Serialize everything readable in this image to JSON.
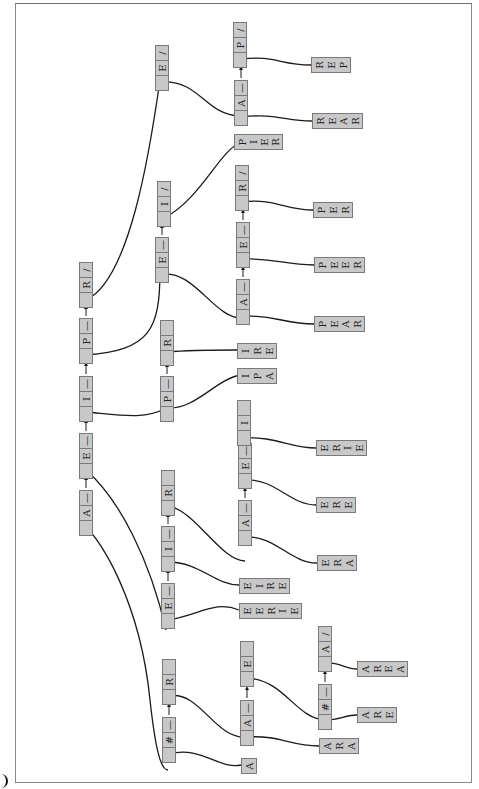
{
  "diagram": {
    "title": "",
    "type": "trie-linked-list",
    "orientation": "rotated-90-ccw",
    "colors": {
      "node_fill": "#c8c8c8",
      "node_border": "#7a7a7a",
      "edge": "#1a1a1a",
      "frame": "#8a8a8a"
    },
    "nodes": [
      {
        "id": "L1-A",
        "x": 79,
        "y": 490,
        "cells": [
          "",
          "A",
          "—"
        ]
      },
      {
        "id": "L1-E",
        "x": 79,
        "y": 433,
        "cells": [
          "",
          "E",
          "—"
        ]
      },
      {
        "id": "L1-I",
        "x": 79,
        "y": 376,
        "cells": [
          "",
          "I",
          "—"
        ]
      },
      {
        "id": "L1-P",
        "x": 79,
        "y": 318,
        "cells": [
          "",
          "P",
          "—"
        ]
      },
      {
        "id": "L1-R",
        "x": 79,
        "y": 262,
        "cells": [
          "",
          "R",
          "/"
        ]
      },
      {
        "id": "A-E",
        "x": 155,
        "y": 45,
        "cells": [
          "",
          "E",
          "/"
        ]
      },
      {
        "id": "P-E",
        "x": 155,
        "y": 237,
        "cells": [
          "",
          "E",
          "—"
        ]
      },
      {
        "id": "P-I",
        "x": 157,
        "y": 181,
        "cells": [
          "",
          "I",
          "/"
        ]
      },
      {
        "id": "I-P",
        "x": 160,
        "y": 376,
        "cells": [
          "",
          "P",
          "—"
        ]
      },
      {
        "id": "I-R",
        "x": 160,
        "y": 320,
        "cells": [
          "",
          "R",
          ""
        ]
      },
      {
        "id": "E-E",
        "x": 161,
        "y": 583,
        "cells": [
          "",
          "E",
          "—"
        ]
      },
      {
        "id": "E-I",
        "x": 161,
        "y": 526,
        "cells": [
          "",
          "I",
          "—"
        ]
      },
      {
        "id": "E-R",
        "x": 161,
        "y": 470,
        "cells": [
          "",
          "R",
          ""
        ]
      },
      {
        "id": "R-H",
        "x": 162,
        "y": 717,
        "cells": [
          "",
          "#",
          "—"
        ]
      },
      {
        "id": "R-R",
        "x": 162,
        "y": 659,
        "cells": [
          "",
          "R",
          ""
        ]
      },
      {
        "id": "AE-A",
        "x": 234,
        "y": 80,
        "cells": [
          "",
          "A",
          "—"
        ]
      },
      {
        "id": "AE-P",
        "x": 233,
        "y": 22,
        "cells": [
          "",
          "P",
          "/"
        ]
      },
      {
        "id": "PE-A",
        "x": 236,
        "y": 279,
        "cells": [
          "",
          "A",
          "—"
        ]
      },
      {
        "id": "PE-E",
        "x": 236,
        "y": 222,
        "cells": [
          "",
          "E",
          "—"
        ]
      },
      {
        "id": "PE-R",
        "x": 235,
        "y": 165,
        "cells": [
          "",
          "R",
          "/"
        ]
      },
      {
        "id": "ER-A",
        "x": 238,
        "y": 500,
        "cells": [
          "",
          "A",
          "—"
        ]
      },
      {
        "id": "ER-E",
        "x": 238,
        "y": 443,
        "cells": [
          "",
          "E",
          "—"
        ]
      },
      {
        "id": "ER-I",
        "x": 237,
        "y": 400,
        "cells": [
          "",
          "I",
          ""
        ]
      },
      {
        "id": "RR-A",
        "x": 240,
        "y": 700,
        "cells": [
          "",
          "A",
          "—"
        ]
      },
      {
        "id": "RR-E",
        "x": 240,
        "y": 641,
        "cells": [
          "",
          "E",
          ""
        ]
      },
      {
        "id": "RRE-H",
        "x": 318,
        "y": 684,
        "cells": [
          "",
          "#",
          "—"
        ]
      },
      {
        "id": "RRE-A",
        "x": 318,
        "y": 626,
        "cells": [
          "",
          "A",
          "/"
        ]
      }
    ],
    "words": [
      {
        "id": "REP",
        "x": 311,
        "y": 57,
        "w": 40,
        "h": 16,
        "letters": [
          "R",
          "E",
          "P"
        ]
      },
      {
        "id": "REAR",
        "x": 312,
        "y": 113,
        "w": 51,
        "h": 16,
        "letters": [
          "R",
          "E",
          "A",
          "R"
        ]
      },
      {
        "id": "PIER",
        "x": 234,
        "y": 134,
        "w": 49,
        "h": 16,
        "letters": [
          "P",
          "I",
          "E",
          "R"
        ]
      },
      {
        "id": "PER",
        "x": 313,
        "y": 202,
        "w": 40,
        "h": 16,
        "letters": [
          "P",
          "E",
          "R"
        ]
      },
      {
        "id": "PEER",
        "x": 314,
        "y": 257,
        "w": 51,
        "h": 16,
        "letters": [
          "P",
          "E",
          "E",
          "R"
        ]
      },
      {
        "id": "PEAR",
        "x": 314,
        "y": 316,
        "w": 51,
        "h": 16,
        "letters": [
          "P",
          "E",
          "A",
          "R"
        ]
      },
      {
        "id": "IRE",
        "x": 237,
        "y": 343,
        "w": 40,
        "h": 16,
        "letters": [
          "I",
          "R",
          "E"
        ]
      },
      {
        "id": "IPA",
        "x": 237,
        "y": 368,
        "w": 40,
        "h": 16,
        "letters": [
          "I",
          "P",
          "A"
        ]
      },
      {
        "id": "ERIE",
        "x": 316,
        "y": 440,
        "w": 51,
        "h": 16,
        "letters": [
          "E",
          "R",
          "I",
          "E"
        ]
      },
      {
        "id": "ERE",
        "x": 316,
        "y": 497,
        "w": 40,
        "h": 16,
        "letters": [
          "E",
          "R",
          "E"
        ]
      },
      {
        "id": "EIRE",
        "x": 239,
        "y": 578,
        "w": 51,
        "h": 16,
        "letters": [
          "E",
          "I",
          "R",
          "E"
        ]
      },
      {
        "id": "EERIE",
        "x": 239,
        "y": 603,
        "w": 63,
        "h": 16,
        "letters": [
          "E",
          "E",
          "R",
          "I",
          "E"
        ]
      },
      {
        "id": "ERA",
        "x": 317,
        "y": 555,
        "w": 40,
        "h": 16,
        "letters": [
          "E",
          "R",
          "A"
        ]
      },
      {
        "id": "AREA",
        "x": 357,
        "y": 661,
        "w": 51,
        "h": 16,
        "letters": [
          "A",
          "R",
          "E",
          "A"
        ]
      },
      {
        "id": "ARE",
        "x": 357,
        "y": 707,
        "w": 40,
        "h": 16,
        "letters": [
          "A",
          "R",
          "E"
        ]
      },
      {
        "id": "ARA",
        "x": 319,
        "y": 738,
        "w": 40,
        "h": 16,
        "letters": [
          "A",
          "R",
          "A"
        ]
      },
      {
        "id": "A",
        "x": 241,
        "y": 758,
        "w": 16,
        "h": 16,
        "letters": [
          "A"
        ]
      }
    ],
    "edges": [
      "M86,527 C100,540 140,600 150,700 C155,745 160,770 168,770",
      "M86,470 C120,500 150,560 166,630",
      "M86,412 C120,415 145,420 166,408",
      "M86,355 C150,350 160,330 160,270",
      "M86,300 C130,280 150,150 160,80",
      "M162,82 C200,80 205,115 240,116",
      "M162,274 C195,270 215,320 243,318",
      "M164,218 C200,200 220,150 240,143",
      "M167,408 C195,410 215,380 240,375",
      "M167,352 C190,350 220,350 237,350",
      "M168,620 C200,615 215,600 239,610",
      "M168,562 C200,562 215,585 239,585",
      "M168,506 C195,510 220,560 245,561",
      "M169,754 C200,745 220,770 241,765",
      "M169,696 C200,690 215,740 247,737",
      "M241,59 C275,55 280,65 311,65",
      "M241,117 C275,113 285,121 312,121",
      "M243,316 C275,315 285,324 314,324",
      "M243,259 C275,258 285,265 314,265",
      "M242,202 C275,198 285,210 313,210",
      "M245,537 C275,535 290,563 317,563",
      "M245,480 C275,478 290,505 316,505",
      "M244,438 C275,436 290,448 316,448",
      "M247,737 C280,735 290,746 319,746",
      "M247,678 C285,680 295,718 325,720",
      "M325,720 C340,720 345,715 357,715",
      "M325,663 C340,662 345,669 357,669"
    ],
    "arrows": [
      [
        86,
        488,
        86,
        478
      ],
      [
        86,
        431,
        86,
        421
      ],
      [
        86,
        374,
        86,
        364
      ],
      [
        86,
        316,
        86,
        307
      ],
      [
        162,
        235,
        162,
        226
      ],
      [
        168,
        581,
        168,
        571
      ],
      [
        168,
        524,
        168,
        515
      ],
      [
        169,
        715,
        169,
        705
      ],
      [
        167,
        374,
        167,
        365
      ],
      [
        241,
        78,
        241,
        68
      ],
      [
        243,
        277,
        243,
        268
      ],
      [
        243,
        220,
        243,
        211
      ],
      [
        245,
        498,
        245,
        489
      ],
      [
        244,
        441,
        244,
        445
      ],
      [
        247,
        698,
        247,
        688
      ],
      [
        325,
        682,
        325,
        672
      ]
    ]
  }
}
